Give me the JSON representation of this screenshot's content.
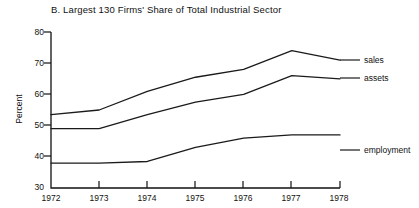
{
  "chart_data": {
    "type": "line",
    "title": "B. Largest 130 Firms' Share of Total Industrial Sector",
    "xlabel": "",
    "ylabel": "Percent",
    "categories": [
      "1972",
      "1973",
      "1974",
      "1975",
      "1976",
      "1977",
      "1978"
    ],
    "x": [
      1972,
      1973,
      1974,
      1975,
      1976,
      1977,
      1978
    ],
    "xlim": [
      1972,
      1978
    ],
    "ylim": [
      30,
      80
    ],
    "yticks": [
      30,
      40,
      50,
      60,
      70,
      80
    ],
    "xticks": [
      1972,
      1973,
      1974,
      1975,
      1976,
      1977,
      1978
    ],
    "grid": false,
    "legend": "right-inline-labels",
    "series": [
      {
        "name": "sales",
        "values": [
          53.5,
          55.0,
          61.0,
          65.5,
          68.0,
          74.0,
          71.0
        ]
      },
      {
        "name": "assets",
        "values": [
          49.0,
          49.0,
          53.5,
          57.5,
          60.0,
          66.0,
          65.0
        ]
      },
      {
        "name": "employment",
        "values": [
          38.0,
          38.0,
          38.5,
          43.0,
          46.0,
          47.0,
          47.0
        ]
      }
    ]
  },
  "axis": {
    "ylabel": "Percent",
    "ytick_labels": [
      "80",
      "70",
      "60",
      "50",
      "40",
      "30"
    ],
    "xtick_labels": [
      "1972",
      "1973",
      "1974",
      "1975",
      "1976",
      "1977",
      "1978"
    ]
  },
  "series_labels": {
    "sales": "sales",
    "assets": "assets",
    "employment": "employment"
  },
  "colors": {
    "ink": "#1a1a1a",
    "background": "#ffffff"
  }
}
